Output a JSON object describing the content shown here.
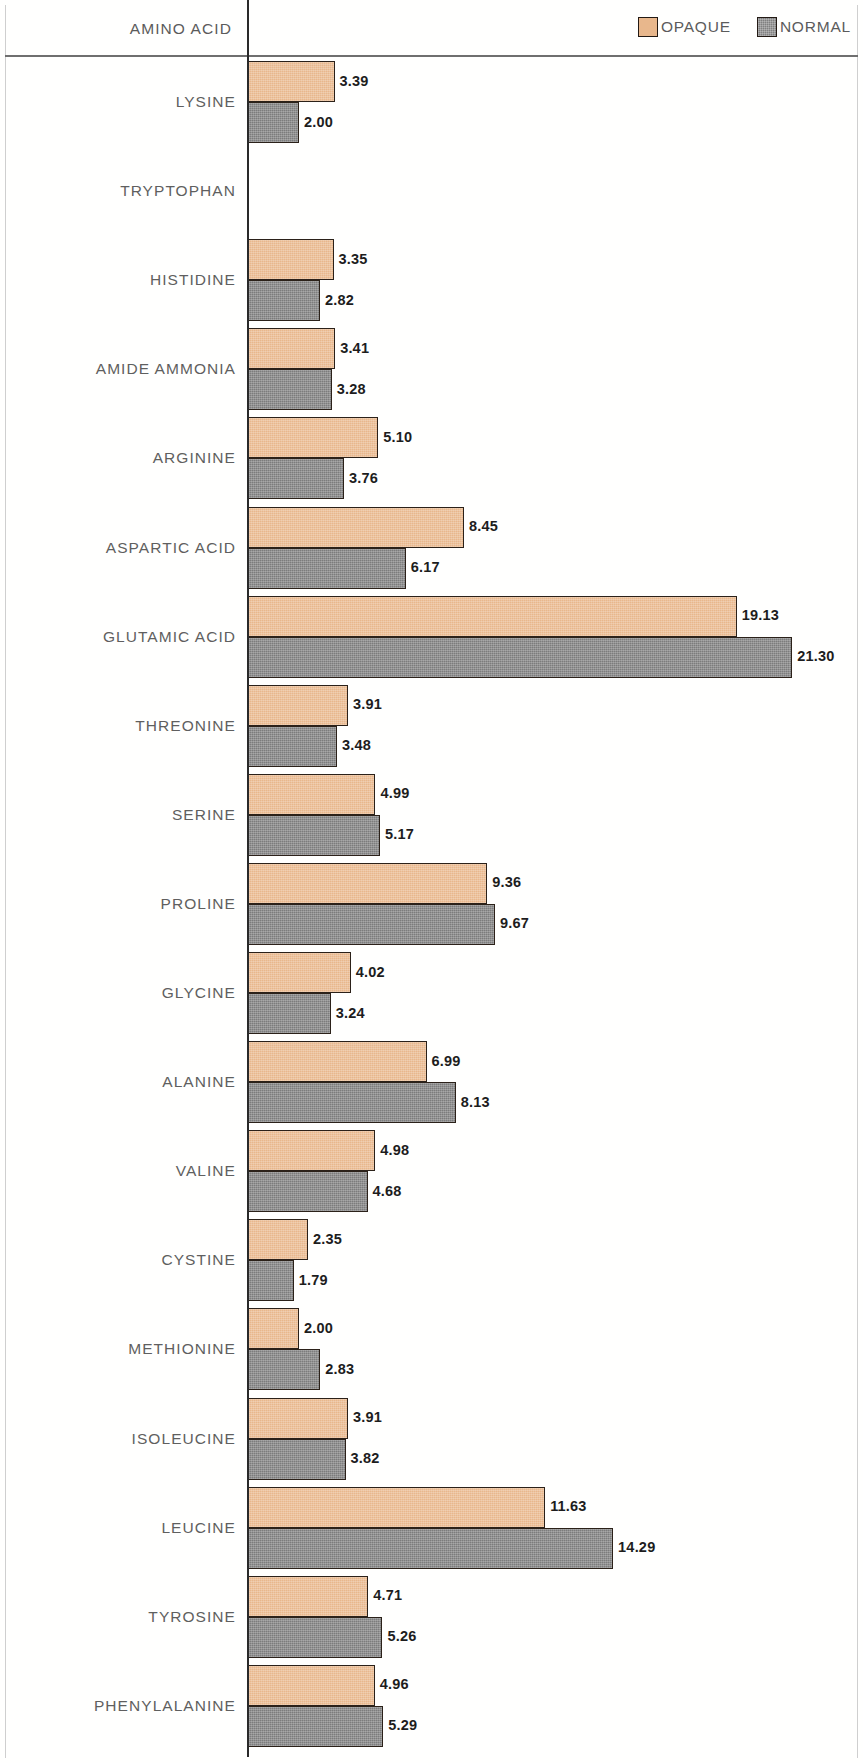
{
  "header": {
    "axis_title": "AMINO ACID",
    "legend": [
      {
        "label": "OPAQUE",
        "color": "#e8b78c",
        "key": "opaque",
        "icon": "legend-swatch-icon"
      },
      {
        "label": "NORMAL",
        "color": "#7c7c7c",
        "key": "normal",
        "icon": "legend-swatch-icon"
      }
    ]
  },
  "colors": {
    "opaque": "#e8b78c",
    "normal": "#7c7c7c",
    "bar_outline": "#2b2119",
    "axis": "#2a2a2a",
    "label_text": "#5f5f5f",
    "value_text": "#1d1d1d",
    "background": "#ffffff"
  },
  "chart_data": {
    "type": "bar",
    "orientation": "horizontal",
    "title": "",
    "subtitle": "",
    "xlabel": "",
    "ylabel": "AMINO ACID",
    "grid": false,
    "legend_position": "top-right",
    "xlim": [
      0,
      23
    ],
    "axis_origin_value": 0,
    "categories": [
      "LYSINE",
      "TRYPTOPHAN",
      "HISTIDINE",
      "AMIDE AMMONIA",
      "ARGININE",
      "ASPARTIC ACID",
      "GLUTAMIC ACID",
      "THREONINE",
      "SERINE",
      "PROLINE",
      "GLYCINE",
      "ALANINE",
      "VALINE",
      "CYSTINE",
      "METHIONINE",
      "ISOLEUCINE",
      "LEUCINE",
      "TYROSINE",
      "PHENYLALANINE"
    ],
    "series": [
      {
        "name": "OPAQUE",
        "color": "#e8b78c",
        "values": [
          3.39,
          null,
          3.35,
          3.41,
          5.1,
          8.45,
          19.13,
          3.91,
          4.99,
          9.36,
          4.02,
          6.99,
          4.98,
          2.35,
          2.0,
          3.91,
          11.63,
          4.71,
          4.96
        ],
        "labels": [
          "3.39",
          "",
          "3.35",
          "3.41",
          "5.10",
          "8.45",
          "19.13",
          "3.91",
          "4.99",
          "9.36",
          "4.02",
          "6.99",
          "4.98",
          "2.35",
          "2.00",
          "3.91",
          "11.63",
          "4.71",
          "4.96"
        ]
      },
      {
        "name": "NORMAL",
        "color": "#7c7c7c",
        "values": [
          2.0,
          null,
          2.82,
          3.28,
          3.76,
          6.17,
          21.3,
          3.48,
          5.17,
          9.67,
          3.24,
          8.13,
          4.68,
          1.79,
          2.83,
          3.82,
          14.29,
          5.26,
          5.29
        ],
        "labels": [
          "2.00",
          "",
          "2.82",
          "3.28",
          "3.76",
          "6.17",
          "21.30",
          "3.48",
          "5.17",
          "9.67",
          "3.24",
          "8.13",
          "4.68",
          "1.79",
          "2.83",
          "3.82",
          "14.29",
          "5.26",
          "5.29"
        ]
      }
    ]
  }
}
